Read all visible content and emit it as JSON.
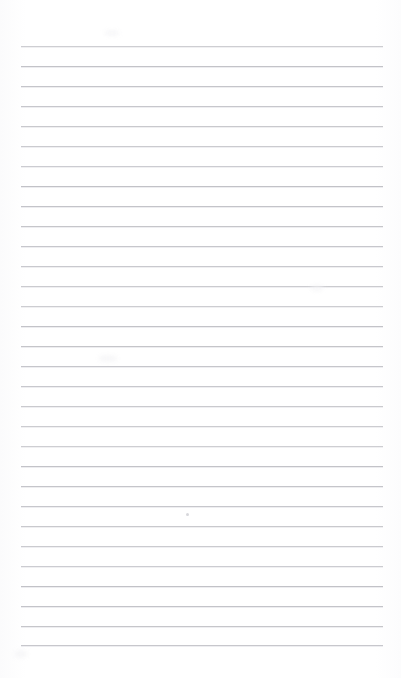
{
  "page": {
    "kind": "scanned-lined-notebook-page",
    "width": 401,
    "height": 678,
    "background_color": "#fefefe",
    "content_text": "",
    "has_handwriting": false,
    "has_printed_text": false
  },
  "ruling": {
    "line_color": "#c2c2c7",
    "line_soft_edge_color": "#ededf0",
    "line_count": 31,
    "line_thickness": 1,
    "spacing": 20,
    "first_line_y": 46,
    "last_line_y": 645,
    "left_x": 21,
    "right_x": 383,
    "top_margin": 46,
    "bottom_margin": 33,
    "left_margin": 21,
    "right_margin": 18,
    "lines_y": [
      46,
      66,
      86,
      106,
      126,
      146,
      166,
      186,
      206,
      226,
      246,
      266,
      286,
      306,
      326,
      346,
      366,
      386,
      406,
      426,
      446,
      466,
      486,
      506,
      526,
      546,
      566,
      586,
      606,
      626,
      645
    ]
  },
  "marks": [
    {
      "name": "pencil-dot",
      "x": 186,
      "y": 513,
      "color": "#c9c9cf"
    }
  ],
  "smudges": [
    {
      "x": 104,
      "y": 30,
      "w": 16,
      "h": 6
    },
    {
      "x": 98,
      "y": 355,
      "w": 20,
      "h": 7
    },
    {
      "x": 14,
      "y": 650,
      "w": 14,
      "h": 8
    },
    {
      "x": 310,
      "y": 285,
      "w": 14,
      "h": 6
    }
  ]
}
